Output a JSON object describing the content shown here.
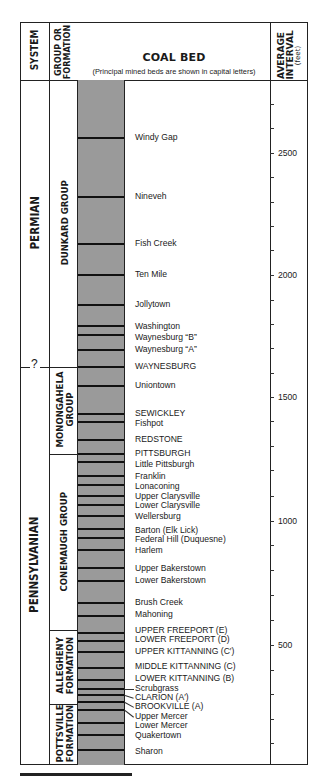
{
  "header": {
    "system": "SYSTEM",
    "group_or_formation_line1": "GROUP OR",
    "group_or_formation_line2": "FORMATION",
    "coal_bed": "COAL BED",
    "coal_bed_note": "(Principal mined beds are shown in capital letters)",
    "average_interval_line1": "AVERAGE",
    "average_interval_line2": "INTERVAL",
    "average_interval_unit": "(feet)"
  },
  "systems": [
    {
      "name": "PERMIAN",
      "top": 80,
      "bottom": 367
    },
    {
      "name": "PENNSYLVANIAN",
      "top": 367,
      "bottom": 765
    }
  ],
  "system_boundary_marker": "?",
  "groups": [
    {
      "line1": "DUNKARD GROUP",
      "line2": "",
      "top": 80,
      "bottom": 367
    },
    {
      "line1": "MONONGAHELA",
      "line2": "GROUP",
      "top": 367,
      "bottom": 454
    },
    {
      "line1": "CONEMAUGH GROUP",
      "line2": "",
      "top": 454,
      "bottom": 630
    },
    {
      "line1": "ALLEGHENY",
      "line2": "FORMATION",
      "top": 630,
      "bottom": 704
    },
    {
      "line1": "POTTSVILLE",
      "line2": "FORMATION",
      "top": 704,
      "bottom": 765
    }
  ],
  "coal_beds": [
    {
      "name": "Windy Gap",
      "line_y": 138,
      "label_y": 138,
      "principal": false
    },
    {
      "name": "Nineveh",
      "line_y": 197,
      "label_y": 197,
      "principal": false
    },
    {
      "name": "Fish Creek",
      "line_y": 244,
      "label_y": 244,
      "principal": false
    },
    {
      "name": "Ten Mile",
      "line_y": 275,
      "label_y": 275,
      "principal": false
    },
    {
      "name": "Jollytown",
      "line_y": 305,
      "label_y": 305,
      "principal": false
    },
    {
      "name": "Washington",
      "line_y": 326,
      "label_y": 327,
      "principal": false
    },
    {
      "name": "Waynesburg “B”",
      "line_y": 335,
      "label_y": 338,
      "principal": false
    },
    {
      "name": "Waynesburg “A”",
      "line_y": 350,
      "label_y": 350,
      "principal": false
    },
    {
      "name": "WAYNESBURG",
      "line_y": 367,
      "label_y": 367,
      "principal": true
    },
    {
      "name": "Uniontown",
      "line_y": 386,
      "label_y": 386,
      "principal": false
    },
    {
      "name": "SEWICKLEY",
      "line_y": 414,
      "label_y": 414,
      "principal": true
    },
    {
      "name": "Fishpot",
      "line_y": 422,
      "label_y": 424,
      "principal": false
    },
    {
      "name": "REDSTONE",
      "line_y": 440,
      "label_y": 440,
      "principal": true
    },
    {
      "name": "PITTSBURGH",
      "line_y": 454,
      "label_y": 454,
      "principal": true
    },
    {
      "name": "Little Pittsburgh",
      "line_y": 462,
      "label_y": 465,
      "principal": false
    },
    {
      "name": "Franklin",
      "line_y": 476,
      "label_y": 477,
      "principal": false
    },
    {
      "name": "Lonaconing",
      "line_y": 485,
      "label_y": 487,
      "principal": false
    },
    {
      "name": "Upper Clarysville",
      "line_y": 496,
      "label_y": 497,
      "principal": false
    },
    {
      "name": "Lower Clarysville",
      "line_y": 505,
      "label_y": 506,
      "principal": false
    },
    {
      "name": "Wellersburg",
      "line_y": 516,
      "label_y": 517,
      "principal": false
    },
    {
      "name": "Barton (Elk Lick)",
      "line_y": 529,
      "label_y": 531,
      "principal": false
    },
    {
      "name": "Federal Hill (Duquesne)",
      "line_y": 538,
      "label_y": 540,
      "principal": false
    },
    {
      "name": "Harlem",
      "line_y": 550,
      "label_y": 551,
      "principal": false
    },
    {
      "name": "Upper Bakerstown",
      "line_y": 568,
      "label_y": 569,
      "principal": false
    },
    {
      "name": "Lower Bakerstown",
      "line_y": 581,
      "label_y": 581,
      "principal": false
    },
    {
      "name": "Brush Creek",
      "line_y": 603,
      "label_y": 603,
      "principal": false
    },
    {
      "name": "Mahoning",
      "line_y": 616,
      "label_y": 615,
      "principal": false
    },
    {
      "name": "UPPER FREEPORT (E)",
      "line_y": 633,
      "label_y": 631,
      "principal": true
    },
    {
      "name": "LOWER FREEPORT (D)",
      "line_y": 641,
      "label_y": 640,
      "principal": true
    },
    {
      "name": "UPPER KITTANNING (C′)",
      "line_y": 652,
      "label_y": 652,
      "principal": true
    },
    {
      "name": "MIDDLE KITTANNING (C)",
      "line_y": 668,
      "label_y": 667,
      "principal": true
    },
    {
      "name": "LOWER KITTANNING (B)",
      "line_y": 680,
      "label_y": 679,
      "principal": true
    },
    {
      "name": "Scrubgrass",
      "line_y": 689,
      "label_y": 689,
      "principal": false,
      "leader": true
    },
    {
      "name": "CLARION (A′)",
      "line_y": 695,
      "label_y": 698,
      "principal": true,
      "leader": true
    },
    {
      "name": "BROOKVILLE (A)",
      "line_y": 702,
      "label_y": 707,
      "principal": true,
      "leader": true
    },
    {
      "name": "Upper Mercer",
      "line_y": 710,
      "label_y": 717,
      "principal": false,
      "leader": true
    },
    {
      "name": "Lower Mercer",
      "line_y": 723,
      "label_y": 726,
      "principal": false
    },
    {
      "name": "Quakertown",
      "line_y": 735,
      "label_y": 736,
      "principal": false
    },
    {
      "name": "Sharon",
      "line_y": 750,
      "label_y": 752,
      "principal": false
    }
  ],
  "interval_axis": {
    "labels": [
      {
        "value": "2500",
        "y": 153
      },
      {
        "value": "2000",
        "y": 275
      },
      {
        "value": "1500",
        "y": 397
      },
      {
        "value": "1000",
        "y": 521
      },
      {
        "value": "500",
        "y": 645
      }
    ],
    "minor_ticks_y": [
      104,
      128,
      177,
      202,
      226,
      250,
      300,
      324,
      348,
      373,
      421,
      446,
      470,
      496,
      545,
      570,
      595,
      620,
      670,
      694,
      719,
      743
    ]
  },
  "colors": {
    "strip_fill": "#9a9a9a",
    "coal_line": "#111111",
    "border": "#222222"
  }
}
